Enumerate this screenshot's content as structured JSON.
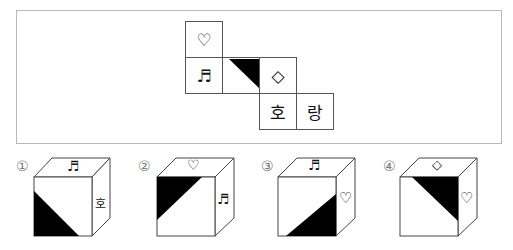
{
  "net": {
    "faces": [
      {
        "id": "top-heart",
        "symbol": "♡",
        "col": 0,
        "row": 0
      },
      {
        "id": "music-note",
        "symbol": "♬",
        "col": 0,
        "row": 1
      },
      {
        "id": "triangle-black",
        "symbol": "",
        "col": 1,
        "row": 1,
        "pattern": "black-triangle-top-right"
      },
      {
        "id": "diamond",
        "symbol": "◇",
        "col": 2,
        "row": 1
      },
      {
        "id": "ho",
        "symbol": "호",
        "col": 2,
        "row": 2
      },
      {
        "id": "rang",
        "symbol": "랑",
        "col": 3,
        "row": 2
      }
    ]
  },
  "options": [
    {
      "number": "①",
      "top": "♬",
      "front": "black-triangle-bottom-left",
      "side": "호"
    },
    {
      "number": "②",
      "top": "♡",
      "front": "black-triangle-top-left",
      "side": "♬"
    },
    {
      "number": "③",
      "top": "♬",
      "front": "black-triangle-bottom-right",
      "side": "♡"
    },
    {
      "number": "④",
      "top": "◇",
      "front": "black-triangle-top-right",
      "side": "♡"
    }
  ],
  "colors": {
    "line": "#444444",
    "fill": "#000000",
    "frame": "#b8b8b8",
    "number": "#777777"
  }
}
